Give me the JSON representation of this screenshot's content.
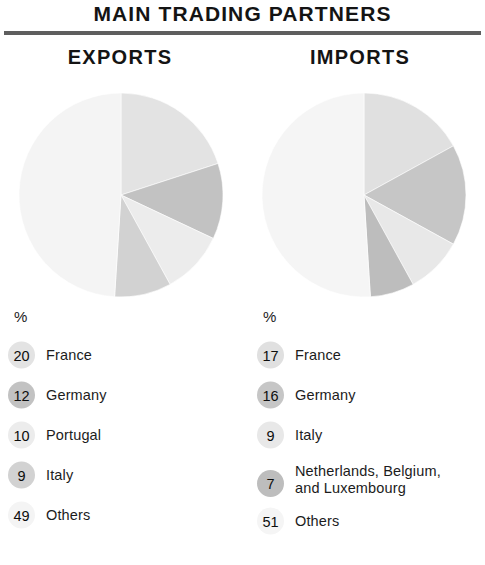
{
  "header": {
    "title": "MAIN TRADING PARTNERS"
  },
  "percent_symbol": "%",
  "columns": [
    {
      "key": "exports",
      "title": "EXPORTS",
      "legend": [
        {
          "value": "20",
          "label": "France",
          "color": "#e3e3e3"
        },
        {
          "value": "12",
          "label": "Germany",
          "color": "#c2c2c2"
        },
        {
          "value": "10",
          "label": "Portugal",
          "color": "#ececec"
        },
        {
          "value": "9",
          "label": "Italy",
          "color": "#d2d2d2"
        },
        {
          "value": "49",
          "label": "Others",
          "color": "#f4f4f4"
        }
      ]
    },
    {
      "key": "imports",
      "title": "IMPORTS",
      "legend": [
        {
          "value": "17",
          "label": "France",
          "color": "#e0e0e0"
        },
        {
          "value": "16",
          "label": "Germany",
          "color": "#c6c6c6"
        },
        {
          "value": "9",
          "label": "Italy",
          "color": "#e8e8e8"
        },
        {
          "value": "7",
          "label": "Netherlands, Belgium,\nand Luxembourg",
          "color": "#bdbdbd"
        },
        {
          "value": "51",
          "label": "Others",
          "color": "#f5f5f5"
        }
      ]
    }
  ],
  "chart_data": [
    {
      "type": "pie",
      "title": "EXPORTS",
      "subtitle": "MAIN TRADING PARTNERS",
      "unit": "%",
      "start_angle": 0,
      "direction": "clockwise",
      "labels": [
        "France",
        "Germany",
        "Portugal",
        "Italy",
        "Others"
      ],
      "values": [
        20,
        12,
        10,
        9,
        49
      ],
      "colors": [
        "#e3e3e3",
        "#c2c2c2",
        "#ececec",
        "#d2d2d2",
        "#f4f4f4"
      ],
      "legend": "below"
    },
    {
      "type": "pie",
      "title": "IMPORTS",
      "subtitle": "MAIN TRADING PARTNERS",
      "unit": "%",
      "start_angle": 0,
      "direction": "clockwise",
      "labels": [
        "France",
        "Germany",
        "Italy",
        "Netherlands, Belgium, and Luxembourg",
        "Others"
      ],
      "values": [
        17,
        16,
        9,
        7,
        51
      ],
      "colors": [
        "#e0e0e0",
        "#c6c6c6",
        "#e8e8e8",
        "#bdbdbd",
        "#f5f5f5"
      ],
      "legend": "below"
    }
  ]
}
